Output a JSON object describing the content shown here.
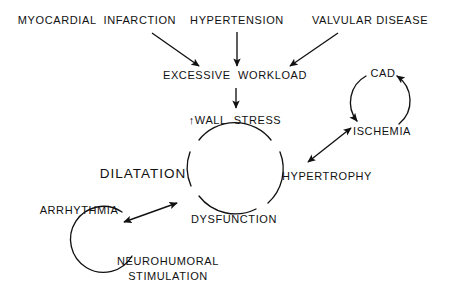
{
  "diagram": {
    "background_color": "#ffffff",
    "stroke_color": "#111111",
    "nodes": {
      "myocardial_infarction": "MYOCARDIAL  INFARCTION",
      "hypertension": "HYPERTENSION",
      "valvular_disease": "VALVULAR DISEASE",
      "excessive_workload": "EXCESSIVE  WORKLOAD",
      "wall_stress": "↑WALL  STRESS",
      "hypertrophy": "HYPERTROPHY",
      "dysfunction": "DYSFUNCTION",
      "dilatation": "DILATATION",
      "cad": "CAD",
      "ischemia": "ISCHEMIA",
      "arrhythmia": "ARRHYTHMIA",
      "neurohumoral_line1": "NEUROHUMORAL",
      "neurohumoral_line2": "STIMULATION"
    },
    "edges": [
      {
        "id": "mi-to-workload",
        "from": "myocardial_infarction",
        "to": "excessive_workload",
        "style": "straight",
        "heads": "single"
      },
      {
        "id": "htn-to-workload",
        "from": "hypertension",
        "to": "excessive_workload",
        "style": "straight",
        "heads": "single"
      },
      {
        "id": "valv-to-workload",
        "from": "valvular_disease",
        "to": "excessive_workload",
        "style": "straight",
        "heads": "single"
      },
      {
        "id": "workload-to-wallstress",
        "from": "excessive_workload",
        "to": "wall_stress",
        "style": "straight",
        "heads": "single"
      },
      {
        "id": "hypertrophy-ischemia",
        "from": "hypertrophy",
        "to": "ischemia",
        "style": "straight",
        "heads": "double"
      },
      {
        "id": "dysfunction-arrhythmia",
        "from": "dysfunction",
        "to": "arrhythmia",
        "style": "straight",
        "heads": "double"
      },
      {
        "id": "cad-to-ischemia",
        "from": "cad",
        "to": "ischemia",
        "style": "arc",
        "heads": "single"
      },
      {
        "id": "ischemia-to-cad",
        "from": "ischemia",
        "to": "cad",
        "style": "arc",
        "heads": "single"
      }
    ],
    "cycles": [
      {
        "id": "main-cycle",
        "members": [
          "wall_stress",
          "hypertrophy",
          "dysfunction",
          "dilatation"
        ],
        "shape": "circle"
      },
      {
        "id": "coronary-cycle",
        "members": [
          "cad",
          "ischemia"
        ],
        "shape": "circle"
      },
      {
        "id": "neurohumoral-cycle",
        "members": [
          "arrhythmia",
          "neurohumoral_stimulation"
        ],
        "shape": "circle"
      }
    ]
  }
}
